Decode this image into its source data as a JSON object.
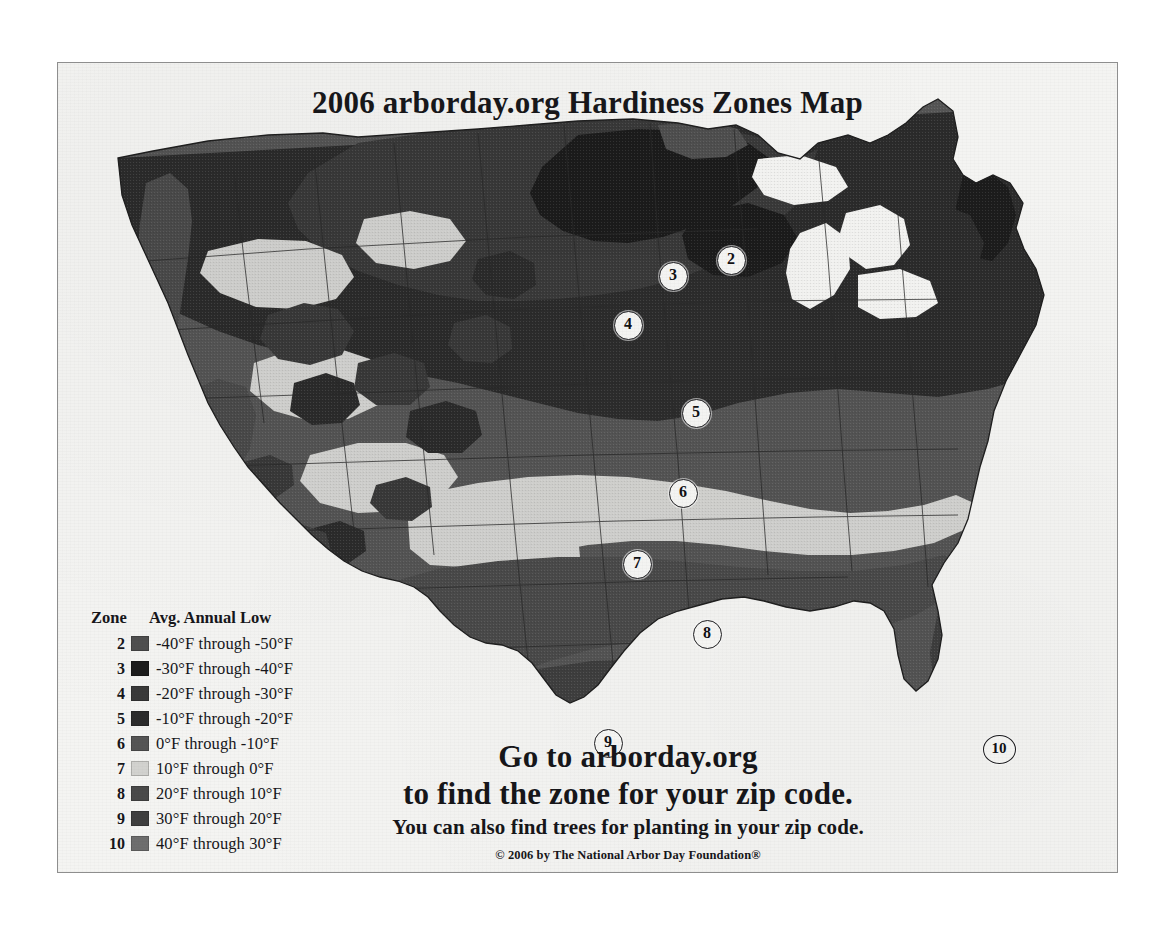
{
  "card": {
    "title": "2006 arborday.org Hardiness Zones Map",
    "background_color": "#f4f4f2",
    "border_color": "#8e8e8e"
  },
  "legend": {
    "header_zone": "Zone",
    "header_temp": "Avg. Annual Low",
    "rows": [
      {
        "zone": "2",
        "temp": "-40°F through -50°F",
        "color": "#4f4f4f"
      },
      {
        "zone": "3",
        "temp": "-30°F through -40°F",
        "color": "#1c1c1c"
      },
      {
        "zone": "4",
        "temp": "-20°F through -30°F",
        "color": "#3a3a3a"
      },
      {
        "zone": "5",
        "temp": "-10°F through -20°F",
        "color": "#2c2c2c"
      },
      {
        "zone": "6",
        "temp": "0°F through -10°F",
        "color": "#555555"
      },
      {
        "zone": "7",
        "temp": "10°F through 0°F",
        "color": "#d2d2cf"
      },
      {
        "zone": "8",
        "temp": "20°F through 10°F",
        "color": "#4a4a4a"
      },
      {
        "zone": "9",
        "temp": "30°F through 20°F",
        "color": "#3f3f3f"
      },
      {
        "zone": "10",
        "temp": "40°F through 30°F",
        "color": "#6e6e6e"
      }
    ]
  },
  "map": {
    "ocean_color": "#f4f4f2",
    "state_border_color": "#2a2a2a",
    "markers": [
      {
        "zone": "2",
        "x": 672,
        "y": 196
      },
      {
        "zone": "3",
        "x": 614,
        "y": 212
      },
      {
        "zone": "4",
        "x": 569,
        "y": 261
      },
      {
        "zone": "5",
        "x": 637,
        "y": 349
      },
      {
        "zone": "6",
        "x": 624,
        "y": 429
      },
      {
        "zone": "7",
        "x": 578,
        "y": 500
      },
      {
        "zone": "8",
        "x": 648,
        "y": 570
      },
      {
        "zone": "9",
        "x": 549,
        "y": 679
      },
      {
        "zone": "10",
        "x": 940,
        "y": 685
      }
    ]
  },
  "promo": {
    "line_1": "Go to arborday.org",
    "line_2": "to find the zone for your zip code.",
    "line_3": "You can also find trees for planting in your zip code.",
    "copyright": "© 2006 by The National Arbor Day Foundation®"
  }
}
